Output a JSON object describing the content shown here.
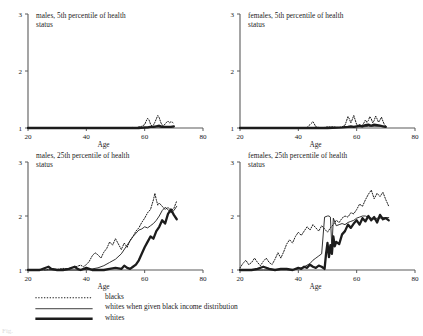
{
  "figure": {
    "caption_partial": "Fig.",
    "panel_layout": "2x2",
    "series_styles": {
      "blacks": "dotted",
      "whites_black_income": "thin-solid",
      "whites": "thick-solid"
    },
    "colors": {
      "ink": "#1c1c1c",
      "axis": "#5a5a5a",
      "background": "#ffffff"
    }
  },
  "legend": {
    "items": [
      {
        "label": "blacks",
        "style": "dotted"
      },
      {
        "label": "whites when given black income distribution",
        "style": "thin-solid"
      },
      {
        "label": "whites",
        "style": "thick-solid"
      }
    ]
  },
  "chart_data": {
    "type": "line",
    "title": "",
    "xlabel": "Age",
    "ylabel": "",
    "xlim": [
      20,
      80
    ],
    "ylim": [
      1,
      3
    ],
    "xticks": [
      20,
      40,
      60,
      80
    ],
    "yticks": [
      1,
      2,
      3
    ],
    "grid": false,
    "legend_position": "below",
    "legend_entries": [
      "blacks",
      "whites when given black income distribution",
      "whites"
    ],
    "panels": [
      {
        "id": "males-5th",
        "title": "males, 5th percentile of health\nstatus",
        "xlabel": "Age",
        "xlim": [
          20,
          80
        ],
        "ylim": [
          1,
          3
        ],
        "xticks": [
          20,
          40,
          60,
          80
        ],
        "yticks": [
          1,
          2,
          3
        ],
        "series": [
          {
            "name": "blacks",
            "style": "dotted",
            "x": [
              20,
              22,
              24,
              26,
              28,
              30,
              32,
              34,
              36,
              38,
              40,
              42,
              44,
              45,
              46,
              48,
              50,
              52,
              54,
              55,
              56,
              57,
              58,
              59,
              60,
              60.5,
              61,
              61.5,
              62,
              62.5,
              63,
              63.5,
              64,
              64.5,
              65,
              65.5,
              66,
              66.5,
              67,
              67.5,
              68,
              68.5,
              69,
              69.5,
              70
            ],
            "y": [
              1.0,
              1.0,
              1.0,
              1.0,
              1.0,
              1.0,
              1.0,
              1.0,
              1.0,
              1.0,
              1.0,
              1.0,
              1.0,
              1.01,
              1.0,
              1.0,
              1.0,
              1.0,
              1.0,
              1.0,
              1.01,
              1.0,
              1.02,
              1.03,
              1.06,
              1.12,
              1.17,
              1.14,
              1.07,
              1.03,
              1.05,
              1.1,
              1.16,
              1.22,
              1.18,
              1.1,
              1.05,
              1.04,
              1.07,
              1.1,
              1.12,
              1.09,
              1.11,
              1.1,
              1.08
            ]
          },
          {
            "name": "whites when given black income distribution",
            "style": "thin-solid",
            "x": [
              20,
              30,
              40,
              50,
              55,
              60,
              62,
              64,
              66,
              68,
              70
            ],
            "y": [
              1.0,
              1.0,
              1.0,
              1.0,
              1.0,
              1.0,
              1.01,
              1.02,
              1.01,
              1.02,
              1.02
            ]
          },
          {
            "name": "whites",
            "style": "thick-solid",
            "x": [
              20,
              30,
              40,
              50,
              55,
              58,
              60,
              61,
              62,
              63,
              64,
              65,
              66,
              67,
              68,
              69,
              70
            ],
            "y": [
              1.0,
              1.0,
              1.0,
              1.0,
              1.0,
              1.0,
              1.01,
              1.01,
              1.02,
              1.02,
              1.03,
              1.04,
              1.02,
              1.02,
              1.02,
              1.02,
              1.03
            ]
          }
        ]
      },
      {
        "id": "females-5th",
        "title": "females, 5th percentile of health\nstatus",
        "xlabel": "Age",
        "xlim": [
          20,
          80
        ],
        "ylim": [
          1,
          3
        ],
        "xticks": [
          20,
          40,
          60,
          80
        ],
        "yticks": [
          1,
          2,
          3
        ],
        "series": [
          {
            "name": "blacks",
            "style": "dotted",
            "x": [
              20,
              24,
              28,
              32,
              36,
              40,
              43,
              44,
              45,
              45.5,
              46,
              47,
              48,
              50,
              52,
              53,
              54,
              55,
              56,
              56.5,
              57,
              57.5,
              58,
              58.5,
              59,
              59.5,
              60,
              60.5,
              61,
              61.5,
              62,
              62.5,
              63,
              63.5,
              64,
              64.5,
              65,
              65.5,
              66,
              66.5,
              67,
              67.5,
              68,
              68.5,
              69,
              69.5,
              70
            ],
            "y": [
              1.0,
              1.0,
              1.0,
              1.0,
              1.0,
              1.0,
              1.01,
              1.06,
              1.11,
              1.07,
              1.02,
              1.01,
              1.0,
              1.02,
              1.02,
              1.01,
              1.01,
              1.02,
              1.05,
              1.12,
              1.2,
              1.16,
              1.09,
              1.15,
              1.22,
              1.14,
              1.06,
              1.04,
              1.06,
              1.04,
              1.05,
              1.09,
              1.14,
              1.1,
              1.13,
              1.2,
              1.16,
              1.09,
              1.13,
              1.21,
              1.16,
              1.1,
              1.14,
              1.19,
              1.12,
              1.06,
              1.03
            ]
          },
          {
            "name": "whites when given black income distribution",
            "style": "thin-solid",
            "x": [
              20,
              30,
              40,
              50,
              56,
              60,
              62,
              64,
              66,
              68,
              70
            ],
            "y": [
              1.0,
              1.0,
              1.0,
              1.0,
              1.01,
              1.02,
              1.02,
              1.03,
              1.03,
              1.03,
              1.02
            ]
          },
          {
            "name": "whites",
            "style": "thick-solid",
            "x": [
              20,
              30,
              40,
              50,
              55,
              57,
              58,
              59,
              60,
              61,
              62,
              63,
              64,
              65,
              66,
              67,
              68,
              69,
              70
            ],
            "y": [
              1.0,
              1.0,
              1.0,
              1.0,
              1.01,
              1.02,
              1.03,
              1.02,
              1.03,
              1.04,
              1.03,
              1.05,
              1.06,
              1.04,
              1.06,
              1.05,
              1.04,
              1.03,
              1.02
            ]
          }
        ]
      },
      {
        "id": "males-25th",
        "title": "males, 25th percentile of health\nstatus",
        "xlabel": "Age",
        "xlim": [
          20,
          80
        ],
        "ylim": [
          1,
          3
        ],
        "xticks": [
          20,
          40,
          60,
          80
        ],
        "yticks": [
          1,
          2,
          3
        ],
        "series": [
          {
            "name": "blacks",
            "style": "dotted",
            "x": [
              20,
              22,
              24,
              26,
              28,
              30,
              32,
              34,
              36,
              38,
              39,
              40,
              41,
              42,
              43,
              44,
              45,
              46,
              47,
              48,
              49,
              50,
              51,
              52,
              53,
              54,
              55,
              56,
              57,
              58,
              59,
              60,
              61,
              62,
              63,
              63.5,
              64,
              64.5,
              65,
              66,
              67,
              68,
              69,
              70,
              71
            ],
            "y": [
              1.0,
              1.0,
              1.01,
              1.0,
              1.02,
              1.01,
              1.03,
              1.02,
              1.05,
              1.09,
              1.06,
              1.1,
              1.16,
              1.26,
              1.32,
              1.28,
              1.22,
              1.33,
              1.4,
              1.52,
              1.46,
              1.58,
              1.48,
              1.38,
              1.5,
              1.42,
              1.55,
              1.62,
              1.72,
              1.78,
              1.88,
              1.96,
              2.06,
              2.12,
              2.3,
              2.42,
              2.3,
              2.2,
              2.24,
              2.18,
              2.12,
              2.16,
              2.1,
              2.14,
              2.28
            ]
          },
          {
            "name": "whites when given black income distribution",
            "style": "thin-solid",
            "x": [
              20,
              26,
              30,
              34,
              38,
              40,
              42,
              44,
              46,
              48,
              50,
              52,
              54,
              56,
              58,
              59,
              60,
              61,
              62,
              63,
              64,
              65,
              66,
              67,
              68,
              69,
              70,
              71
            ],
            "y": [
              1.0,
              1.0,
              1.0,
              1.0,
              1.0,
              1.01,
              1.02,
              1.04,
              1.08,
              1.14,
              1.2,
              1.3,
              1.46,
              1.62,
              1.74,
              1.76,
              1.8,
              1.78,
              1.82,
              1.86,
              1.92,
              2.0,
              2.1,
              2.16,
              2.12,
              2.06,
              2.1,
              2.18
            ]
          },
          {
            "name": "whites",
            "style": "thick-solid",
            "x": [
              20,
              24,
              27,
              28,
              30,
              32,
              34,
              36,
              37,
              38,
              40,
              41,
              42,
              44,
              46,
              48,
              50,
              52,
              53,
              54,
              55,
              56,
              57,
              58,
              59,
              60,
              61,
              62,
              63,
              64,
              65,
              66,
              67,
              68,
              69,
              70,
              71
            ],
            "y": [
              1.0,
              1.0,
              1.06,
              1.02,
              1.0,
              1.0,
              1.02,
              1.06,
              1.02,
              1.0,
              1.04,
              1.02,
              1.0,
              1.0,
              1.0,
              1.02,
              1.04,
              1.02,
              1.08,
              1.04,
              1.02,
              1.06,
              1.1,
              1.18,
              1.3,
              1.42,
              1.52,
              1.62,
              1.58,
              1.72,
              1.8,
              1.92,
              1.86,
              2.04,
              2.12,
              2.02,
              1.94
            ]
          }
        ]
      },
      {
        "id": "females-25th",
        "title": "females, 25th percentile of health\nstatus",
        "xlabel": "Age",
        "xlim": [
          20,
          80
        ],
        "ylim": [
          1,
          3
        ],
        "xticks": [
          20,
          40,
          60,
          80
        ],
        "yticks": [
          1,
          2,
          3
        ],
        "series": [
          {
            "name": "blacks",
            "style": "dotted",
            "x": [
              20,
              21,
              22,
              23,
              24,
              25,
              26,
              27,
              28,
              29,
              30,
              31,
              32,
              33,
              34,
              35,
              36,
              37,
              38,
              39,
              40,
              41,
              42,
              43,
              44,
              45,
              46,
              47,
              48,
              49,
              50,
              51,
              52,
              53,
              54,
              55,
              56,
              57,
              58,
              59,
              60,
              61,
              62,
              63,
              64,
              65,
              66,
              67,
              68,
              69,
              70,
              71
            ],
            "y": [
              1.04,
              1.12,
              1.18,
              1.1,
              1.14,
              1.22,
              1.14,
              1.08,
              1.16,
              1.22,
              1.14,
              1.1,
              1.2,
              1.32,
              1.22,
              1.34,
              1.48,
              1.56,
              1.5,
              1.62,
              1.7,
              1.64,
              1.72,
              1.8,
              1.74,
              1.84,
              1.78,
              1.72,
              1.82,
              1.76,
              1.7,
              1.78,
              1.84,
              1.92,
              1.88,
              1.96,
              2.0,
              1.98,
              2.06,
              2.04,
              2.12,
              2.22,
              2.18,
              2.3,
              2.4,
              2.48,
              2.32,
              2.42,
              2.36,
              2.44,
              2.3,
              2.18
            ]
          },
          {
            "name": "whites when given black income distribution",
            "style": "thin-solid",
            "x": [
              20,
              28,
              34,
              38,
              40,
              42,
              44,
              45,
              46,
              47,
              48,
              49,
              50,
              50.5,
              51,
              51.5,
              52,
              53,
              54,
              55,
              56,
              57,
              58,
              59,
              60,
              61,
              62,
              63,
              64,
              65,
              66,
              67,
              68,
              69,
              70,
              71
            ],
            "y": [
              1.0,
              1.0,
              1.0,
              1.0,
              1.02,
              1.06,
              1.12,
              1.18,
              1.22,
              1.26,
              1.3,
              1.98,
              2.0,
              2.0,
              1.98,
              1.4,
              1.96,
              1.82,
              1.84,
              1.86,
              1.84,
              1.88,
              1.9,
              1.92,
              1.96,
              1.98,
              2.0,
              2.0,
              1.98,
              1.96,
              1.94,
              1.96,
              1.96,
              1.97,
              1.97,
              1.97
            ]
          },
          {
            "name": "whites",
            "style": "thick-solid",
            "x": [
              20,
              24,
              26,
              28,
              30,
              32,
              34,
              36,
              38,
              40,
              41,
              42,
              43,
              44,
              45,
              46,
              47,
              48,
              49,
              49.5,
              50,
              50.5,
              51,
              51.5,
              52,
              52.5,
              53,
              54,
              55,
              56,
              57,
              58,
              59,
              60,
              61,
              62,
              63,
              64,
              65,
              66,
              67,
              68,
              69,
              70,
              71
            ],
            "y": [
              1.0,
              1.0,
              1.02,
              1.06,
              1.02,
              1.0,
              1.02,
              1.02,
              1.0,
              1.04,
              1.02,
              1.06,
              1.04,
              1.1,
              1.06,
              1.04,
              1.08,
              1.06,
              1.02,
              1.3,
              1.5,
              1.24,
              1.46,
              1.3,
              1.62,
              1.44,
              1.52,
              1.48,
              1.66,
              1.72,
              1.84,
              1.78,
              1.86,
              1.92,
              1.84,
              1.96,
              1.9,
              2.0,
              1.92,
              1.98,
              1.88,
              2.02,
              1.94,
              1.96,
              1.92
            ]
          }
        ]
      }
    ]
  }
}
